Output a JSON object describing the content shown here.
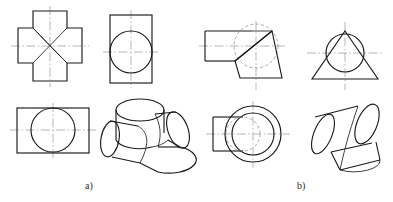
{
  "figure": {
    "background_color": "#ffffff",
    "outline_color": "#1b1b1b",
    "hidden_line_color": "#8d8d8d",
    "center_line_color": "#9a9a9a",
    "captions": [
      {
        "id": "a",
        "label": "a)",
        "x": 85,
        "y": 180
      },
      {
        "id": "b",
        "label": "b)",
        "x": 297,
        "y": 180
      }
    ]
  },
  "groups": [
    {
      "id": "group-a",
      "caption": "a)",
      "description": "Two equal cylinders intersecting at right angles (cross / four-way tee)",
      "views": [
        {
          "id": "a-top-view",
          "name": "top-view-cross",
          "type": "orthographic",
          "shape": "cross-shaped outline with corner diagonals",
          "bounds": {
            "x": 18,
            "y": 11,
            "w": 64,
            "h": 70
          }
        },
        {
          "id": "a-front-view",
          "name": "front-view-rect-circle",
          "type": "orthographic",
          "shape": "rectangle with inscribed circle",
          "bounds": {
            "x": 110,
            "y": 15,
            "w": 42,
            "h": 68
          }
        },
        {
          "id": "a-side-view",
          "name": "side-view-rect-circle",
          "type": "orthographic",
          "shape": "wide rectangle with inscribed circle",
          "bounds": {
            "x": 17,
            "y": 108,
            "w": 72,
            "h": 45
          }
        },
        {
          "id": "a-pictorial",
          "name": "isometric-cross-cylinders",
          "type": "isometric",
          "shape": "two cylinders meeting at 90 degrees",
          "bounds": {
            "x": 103,
            "y": 98,
            "w": 85,
            "h": 72
          }
        }
      ]
    },
    {
      "id": "group-b",
      "caption": "b)",
      "description": "Cylinder intersecting a cone",
      "views": [
        {
          "id": "b-top-view",
          "name": "top-view-cone-cylinder",
          "type": "orthographic",
          "shape": "rectangle joined to trapezoid with hidden circle",
          "bounds": {
            "x": 205,
            "y": 30,
            "w": 75,
            "h": 55
          }
        },
        {
          "id": "b-front-view",
          "name": "front-view-triangle-circle",
          "type": "orthographic",
          "shape": "triangle (cone) with circle (cylinder)",
          "bounds": {
            "x": 312,
            "y": 30,
            "w": 66,
            "h": 54
          }
        },
        {
          "id": "b-side-view",
          "name": "side-view-circles-rect",
          "type": "orthographic",
          "shape": "concentric circles with rectangle on left and hidden circle",
          "bounds": {
            "x": 213,
            "y": 106,
            "w": 70,
            "h": 57
          }
        },
        {
          "id": "b-pictorial",
          "name": "isometric-cone-cylinder",
          "type": "isometric",
          "shape": "cylinder penetrating an inclined cone",
          "bounds": {
            "x": 312,
            "y": 104,
            "w": 72,
            "h": 66
          }
        }
      ]
    }
  ]
}
